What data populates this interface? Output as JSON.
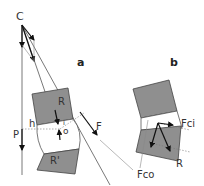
{
  "panels": {
    "a": {
      "label": "a",
      "point_labels": {
        "center": "C",
        "force": "F",
        "weight": "P",
        "lever_arm": "h",
        "block_upper": "R",
        "block_lower": "R'",
        "pivot": "o",
        "inner": "i"
      }
    },
    "b": {
      "label": "b",
      "point_labels": {
        "inner_force": "Fci",
        "outer_force": "Fco",
        "resultant": "R"
      }
    }
  },
  "colors": {
    "block_fill": "#8f8f8f",
    "line": "#555555",
    "arrow": "#111111"
  }
}
